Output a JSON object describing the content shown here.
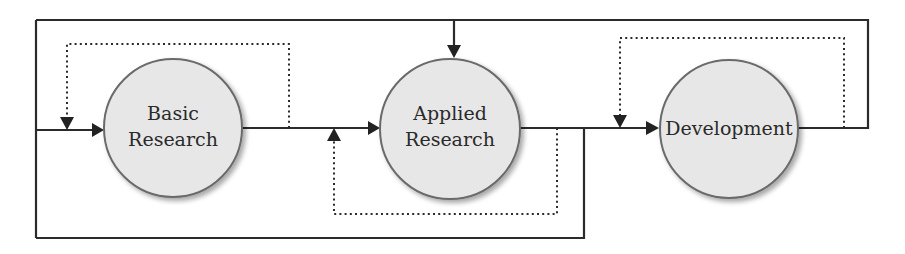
{
  "diagram": {
    "type": "flow-diagram",
    "nodes": [
      {
        "id": "basic",
        "lines": [
          "Basic",
          "Research"
        ]
      },
      {
        "id": "applied",
        "lines": [
          "Applied",
          "Research"
        ]
      },
      {
        "id": "development",
        "lines": [
          "Development"
        ]
      }
    ],
    "edges": [
      {
        "from": "input",
        "to": "basic",
        "style": "solid"
      },
      {
        "from": "basic",
        "to": "applied",
        "style": "solid"
      },
      {
        "from": "applied",
        "to": "development",
        "style": "solid"
      },
      {
        "from": "basic",
        "to": "basic",
        "style": "dotted",
        "kind": "feedback-loop"
      },
      {
        "from": "applied",
        "to": "applied",
        "style": "dotted",
        "kind": "feedback-loop"
      },
      {
        "from": "development",
        "to": "development",
        "style": "dotted",
        "kind": "feedback-loop"
      },
      {
        "from": "development",
        "to": "applied",
        "style": "solid",
        "kind": "top-return"
      },
      {
        "from": "applied",
        "to": "basic",
        "style": "solid",
        "kind": "bottom-return"
      }
    ],
    "colors": {
      "line": "#2b2b2b",
      "circle_fill": "#e7e7e7",
      "circle_stroke": "#6a6a6a"
    }
  }
}
